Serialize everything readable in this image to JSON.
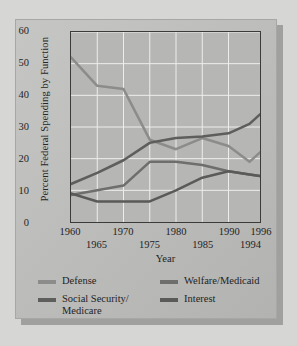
{
  "chart_data": {
    "type": "line",
    "title": "",
    "xlabel": "Year",
    "ylabel": "Percent Federal Spending by Function",
    "xlim": [
      1960,
      1996
    ],
    "ylim": [
      0,
      60
    ],
    "grid": true,
    "legend_position": "bottom",
    "x": [
      1960,
      1965,
      1970,
      1975,
      1980,
      1985,
      1990,
      1994,
      1996
    ],
    "xticks_top": [
      "1960",
      "1970",
      "1980",
      "1990",
      "1996"
    ],
    "xticks_bottom": [
      "1965",
      "1975",
      "1985",
      "1994"
    ],
    "yticks": [
      "0",
      "10",
      "20",
      "30",
      "40",
      "50",
      "60"
    ],
    "series": [
      {
        "name": "Defense",
        "color": "#8c8c8a",
        "values": [
          52,
          43,
          42,
          26,
          23,
          26.5,
          24,
          19,
          22
        ]
      },
      {
        "name": "Social Security/\nMedicare",
        "color": "#5e5e5c",
        "values": [
          12,
          15.5,
          19.5,
          25,
          26.5,
          27,
          28,
          31,
          34
        ]
      },
      {
        "name": "Welfare/Medicaid",
        "color": "#6e6e6c",
        "values": [
          8.5,
          10,
          11.5,
          19,
          19,
          18,
          16,
          15,
          14.5
        ]
      },
      {
        "name": "Interest",
        "color": "#5a5a58",
        "values": [
          9,
          6.5,
          6.5,
          6.5,
          10,
          14,
          16,
          15,
          14.5
        ]
      }
    ]
  },
  "legend": {
    "items": [
      {
        "label": "Defense"
      },
      {
        "label": "Welfare/Medicaid"
      },
      {
        "label": "Social Security/\nMedicare"
      },
      {
        "label": "Interest"
      }
    ]
  },
  "axes": {
    "xlabel": "Year",
    "ylabel": "Percent Federal Spending by Function"
  }
}
